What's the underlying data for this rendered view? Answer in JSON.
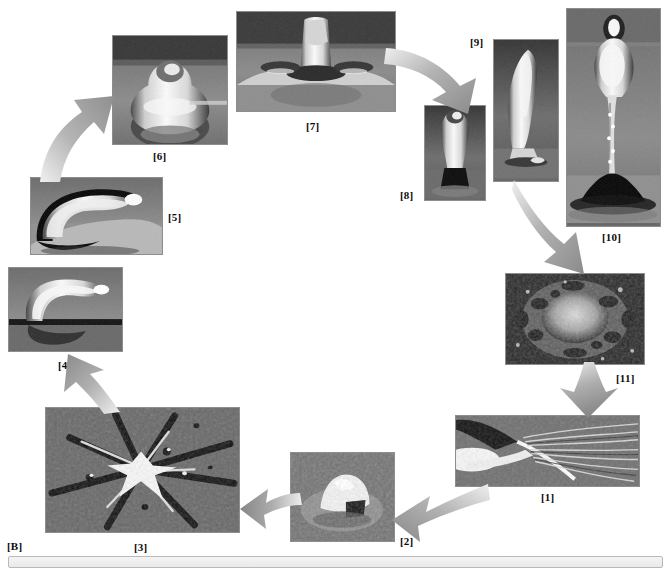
{
  "figure": {
    "panel_label": "[B]",
    "caption_box_text": "",
    "background_color": "#ffffff",
    "arrow_color": "#9a9a9a",
    "label_color": "#0c0c0c"
  },
  "panels": [
    {
      "id": "panel-1",
      "label": "[1]",
      "description": "grayscale high-speed photograph of splash ejecta streaks on a surface"
    },
    {
      "id": "panel-2",
      "label": "[2]",
      "description": "grayscale photograph of a small crater mound with bright peak on granular surface"
    },
    {
      "id": "panel-3",
      "label": "[3]",
      "description": "grayscale photograph of a radial star-shaped crater with dark cracks"
    },
    {
      "id": "panel-4",
      "label": "[4]",
      "description": "grayscale photograph of a curved liquid arch rising off a reflective surface"
    },
    {
      "id": "panel-5",
      "label": "[5]",
      "description": "grayscale photograph of an elongated liquid tongue bending over a reflective surface"
    },
    {
      "id": "panel-6",
      "label": "[6]",
      "description": "grayscale photograph of a rounded liquid blob with a small cap on top"
    },
    {
      "id": "panel-7",
      "label": "[7]",
      "description": "grayscale photograph of a liquid column rising from a flattened crown"
    },
    {
      "id": "panel-8",
      "label": "[8]",
      "description": "grayscale photograph of a small teardrop-shaped liquid column"
    },
    {
      "id": "panel-9",
      "label": "[9]",
      "description": "grayscale photograph of a tall slender liquid column"
    },
    {
      "id": "panel-10",
      "label": "[10]",
      "description": "grayscale photograph of a very tall liquid jet with bulbous head and thin neck"
    },
    {
      "id": "panel-11",
      "label": "[11]",
      "description": "grayscale micrograph of a rough circular splat deposit"
    }
  ],
  "arrows": [
    {
      "id": "arrow-5-to-6",
      "from": "[5]",
      "to": "[6]",
      "direction": "up-right"
    },
    {
      "id": "arrow-7-to-8",
      "from": "[7]",
      "to": "[8]",
      "direction": "down-right"
    },
    {
      "id": "arrow-9-to-11",
      "from": "[9]",
      "to": "[11]",
      "direction": "down-right"
    },
    {
      "id": "arrow-11-to-1",
      "from": "[11]",
      "to": "[1]",
      "direction": "down-left"
    },
    {
      "id": "arrow-1-to-2",
      "from": "[1]",
      "to": "[2]",
      "direction": "down-left"
    },
    {
      "id": "arrow-2-to-3",
      "from": "[2]",
      "to": "[3]",
      "direction": "left"
    },
    {
      "id": "arrow-3-to-4",
      "from": "[3]",
      "to": "[4]",
      "direction": "up-left"
    }
  ]
}
